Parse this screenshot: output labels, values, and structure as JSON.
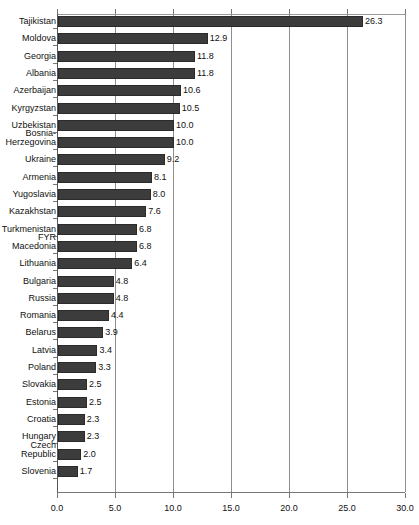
{
  "chart_data": {
    "type": "bar",
    "orientation": "horizontal",
    "title": "",
    "subtitle": "",
    "xlabel": "",
    "ylabel": "",
    "xlim": [
      0.0,
      30.0
    ],
    "xticks": [
      "0.0",
      "5.0",
      "10.0",
      "15.0",
      "20.0",
      "25.0",
      "30.0"
    ],
    "xtick_values": [
      0.0,
      5.0,
      10.0,
      15.0,
      20.0,
      25.0,
      30.0
    ],
    "grid": true,
    "grid_axis": "x",
    "legend": null,
    "bar_color": "#3c3c3c",
    "value_label_format": "one decimal",
    "categories": [
      "Tajikistan",
      "Moldova",
      "Georgia",
      "Albania",
      "Azerbaijan",
      "Kyrgyzstan",
      "Uzbekistan",
      "Bosnia-\nHerzegovina",
      "Ukraine",
      "Armenia",
      "Yugoslavia",
      "Kazakhstan",
      "Turkmenistan",
      "FYR\nMacedonia",
      "Lithuania",
      "Bulgaria",
      "Russia",
      "Romania",
      "Belarus",
      "Latvia",
      "Poland",
      "Slovakia",
      "Estonia",
      "Croatia",
      "Hungary",
      "Czech\nRepublic",
      "Slovenia"
    ],
    "values": [
      26.3,
      12.9,
      11.8,
      11.8,
      10.6,
      10.5,
      10.0,
      10.0,
      9.2,
      8.1,
      8.0,
      7.6,
      6.8,
      6.8,
      6.4,
      4.8,
      4.8,
      4.4,
      3.9,
      3.4,
      3.3,
      2.5,
      2.5,
      2.3,
      2.3,
      2.0,
      1.7
    ],
    "value_labels": [
      "26.3",
      "12.9",
      "11.8",
      "11.8",
      "10.6",
      "10.5",
      "10.0",
      "10.0",
      "9.2",
      "8.1",
      "8.0",
      "7.6",
      "6.8",
      "6.8",
      "6.4",
      "4.8",
      "4.8",
      "4.4",
      "3.9",
      "3.4",
      "3.3",
      "2.5",
      "2.5",
      "2.3",
      "2.3",
      "2.0",
      "1.7"
    ],
    "label_lines": [
      1,
      1,
      1,
      1,
      1,
      1,
      1,
      2,
      1,
      1,
      1,
      1,
      1,
      2,
      1,
      1,
      1,
      1,
      1,
      1,
      1,
      1,
      1,
      1,
      1,
      2,
      1
    ]
  }
}
